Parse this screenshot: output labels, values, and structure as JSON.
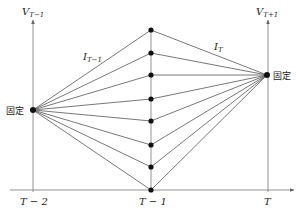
{
  "axes": {
    "left_axis_label": "V",
    "left_axis_sub": "T−1",
    "right_axis_label": "V",
    "right_axis_sub": "T+1",
    "ticks": [
      "T − 2",
      "T − 1",
      "T"
    ]
  },
  "labels": {
    "left_fixed": "固定",
    "right_fixed": "固定",
    "interval_left": "I",
    "interval_left_sub": "T−1",
    "interval_right": "I",
    "interval_right_sub": "T"
  },
  "geometry": {
    "left_fixed_point": [
      33,
      110
    ],
    "right_fixed_point": [
      267,
      75
    ],
    "middle_x": 151,
    "middle_points_y": [
      30,
      53,
      75,
      99,
      121,
      145,
      167,
      190
    ],
    "baseline_y": 190
  },
  "colors": {
    "line": "#555555",
    "dot": "#111111",
    "axis": "#777777"
  }
}
